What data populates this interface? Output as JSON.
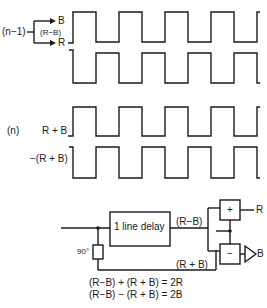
{
  "colors": {
    "stroke": "#1a1a1a",
    "background": "#ffffff"
  },
  "waveform_group_n_minus_1": {
    "label": "(n−1)",
    "branch_top_label": "B",
    "branch_middle_label": "(R−B)",
    "branch_bottom_label": "R",
    "signals": [
      {
        "name": "upper",
        "polarity": "positive"
      },
      {
        "name": "lower",
        "polarity": "inverted"
      }
    ]
  },
  "waveform_group_n": {
    "label": "(n)",
    "signals": [
      {
        "label": "R + B",
        "polarity": "positive"
      },
      {
        "label": "−(R + B)",
        "polarity": "inverted"
      }
    ]
  },
  "block_diagram": {
    "delay_block_label": "1 line delay",
    "phase_shift_label": "90°",
    "delay_output_label": "(R−B)",
    "bypass_label": "(R + B)",
    "adder_label": "+",
    "subtractor_label": "−",
    "adder_output_label": "R",
    "subtractor_output_label": "B"
  },
  "equations": [
    "(R−B) + (R + B) = 2R",
    "(R−B) − (R + B) = 2B"
  ]
}
